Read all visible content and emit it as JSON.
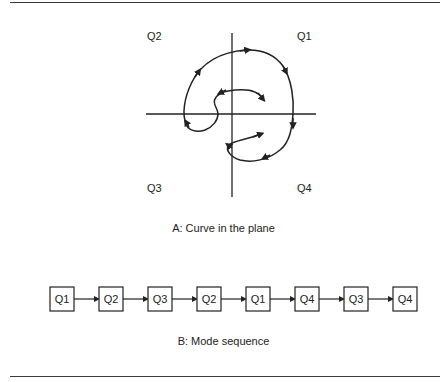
{
  "figure": {
    "part_a": {
      "caption": "A: Curve in the plane",
      "quadrant_labels": {
        "q1": "Q1",
        "q2": "Q2",
        "q3": "Q3",
        "q4": "Q4"
      }
    },
    "part_b": {
      "caption": "B: Mode sequence",
      "sequence": [
        "Q1",
        "Q2",
        "Q3",
        "Q2",
        "Q1",
        "Q4",
        "Q3",
        "Q4"
      ]
    }
  },
  "colors": {
    "ink": "#222222",
    "rule": "#3a3a3a",
    "background": "#ffffff"
  }
}
